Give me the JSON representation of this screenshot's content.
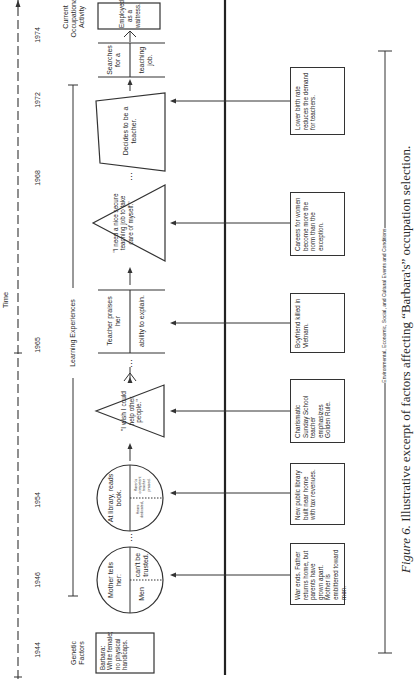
{
  "figure": {
    "time_axis_label": "Time",
    "years": [
      {
        "label": "1944",
        "x": 33
      },
      {
        "label": "1946",
        "x": 103
      },
      {
        "label": "1954",
        "x": 183
      },
      {
        "label": "1965",
        "x": 338
      },
      {
        "label": "1968",
        "x": 505
      },
      {
        "label": "1972",
        "x": 583
      },
      {
        "label": "1974",
        "x": 648
      }
    ],
    "section_labels": {
      "genetic": "Genetic Factors",
      "learning": "Learning Experiences",
      "current": "Current Occupational Activity",
      "environmental": "Environmental, Economic, Social, and Cultural Events and Conditions"
    },
    "genetic_box": "Barbara: White female; no physical handicaps.",
    "learning_experiences": [
      {
        "shape": "circle",
        "title": "Mother tells her:",
        "left": "Men",
        "right": "can't be trusted."
      },
      {
        "shape": "circle",
        "title": "At library, reads book.",
        "left": "Hears dedicated,",
        "right": "Karen's competent teacher praised."
      },
      {
        "shape": "triangle",
        "text": "\"I wish I could help other people.\""
      },
      {
        "shape": "split-rect",
        "top": "Teacher praises her",
        "bottom": "ability to explain."
      },
      {
        "shape": "triangle",
        "text": "\"I need a nice secure teaching job to take care of myself.\""
      },
      {
        "shape": "trapezoid",
        "text": "Decides to be a teacher."
      },
      {
        "shape": "split-rect",
        "top": "Searches for a",
        "bottom": "teaching job."
      }
    ],
    "current_activity": "Employed as a waitress.",
    "ellipsis": "...",
    "environmental_events": [
      "War ends. Father returns home, but parents have grown apart. Mother is embittered toward men.",
      "New public library built near home with tax revenues.",
      "Charismatic Sunday School teacher emphasizes Golden Rule.",
      "Boyfriend killed in Vietnam.",
      "Careers for women become more the norm than the exception.",
      "Lower birth rate reduces the demand for teachers."
    ],
    "caption_prefix": "Figure 6.",
    "caption_text": " Illustrative excerpt of factors affecting “Barbara's” occupation selection."
  },
  "colors": {
    "ink": "#2a2a2a",
    "background": "#ffffff"
  }
}
